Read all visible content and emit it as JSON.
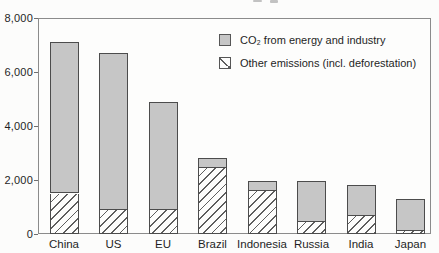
{
  "figure": {
    "background": "#fcfcfb",
    "frame_color": "#8b8b8b",
    "bar_border_color": "#4c4c4c",
    "gray_fill": "#c6c6c6",
    "hatch_line_color": "#5e5e5e",
    "text_color": "#1f1f1f"
  },
  "chart_data": {
    "type": "bar",
    "stacked": true,
    "title": "",
    "xlabel": "",
    "ylabel": "",
    "categories": [
      "China",
      "US",
      "EU",
      "Brazil",
      "Indonesia",
      "Russia",
      "India",
      "Japan"
    ],
    "series": [
      {
        "name": "CO₂ from energy and industry",
        "style": "gray-fill",
        "values": [
          5600,
          5800,
          4000,
          350,
          350,
          1500,
          1150,
          1200
        ]
      },
      {
        "name": "Other emissions (incl. deforestation)",
        "style": "diagonal-hatch",
        "values": [
          1500,
          900,
          900,
          2450,
          1600,
          450,
          650,
          100
        ]
      }
    ],
    "stack_bottom_series_index": 1,
    "totals": [
      7100,
      6700,
      4900,
      2800,
      1950,
      1950,
      1800,
      1300
    ],
    "ylim": [
      0,
      8000
    ],
    "yticks": [
      0,
      2000,
      4000,
      6000,
      8000
    ],
    "ytick_labels": [
      "0",
      "2,000",
      "4,000",
      "6,000",
      "8,000"
    ],
    "grid": false,
    "legend_position": "top-right-inside"
  }
}
